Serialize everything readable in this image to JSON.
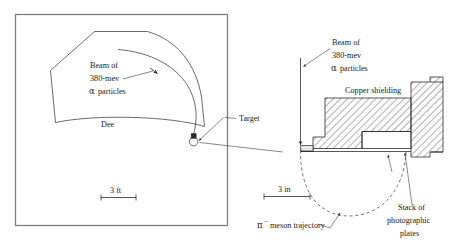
{
  "figure": {
    "panels": [
      "cyclotron-plan-view",
      "target-shielding-detail"
    ]
  },
  "left_panel": {
    "name": "cyclotron-plan-view",
    "beam_label_line1": "Beam of",
    "beam_label_line2": "380-mev",
    "beam_label_line3_symbol": "α",
    "beam_label_line3_text": "particles",
    "dee_label": "Dee",
    "target_label": "Target",
    "scale_label": "3 ft"
  },
  "right_panel": {
    "name": "target-shielding-detail",
    "beam_label_line1": "Beam of",
    "beam_label_line2": "380-mev",
    "beam_label_line3_symbol": "α",
    "beam_label_line3_text": "particles",
    "shielding_label": "Copper shielding",
    "trajectory_symbol": "π",
    "trajectory_superscript": "−",
    "trajectory_label": "meson trajectory",
    "plates_label_line1": "Stack of",
    "plates_label_line2": "photographic",
    "plates_label_line3": "plates",
    "scale_label": "3 in"
  },
  "colors": {
    "ink": "#1a1a1a",
    "line": "#2b2b2b",
    "frame": "#7d7d7d",
    "dashed": "#4a4a4a",
    "background": "#ffffff"
  }
}
